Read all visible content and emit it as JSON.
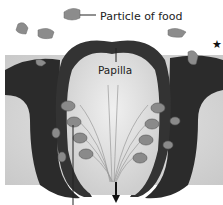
{
  "diagram": {
    "labels": {
      "particle": "Particle of food",
      "papilla": "Papilla"
    },
    "marker": "★",
    "colors": {
      "tissue_dark": "#2a2a2a",
      "tissue_mid": "#4a4a4a",
      "background_tissue": "#d8d8d8",
      "papilla_fill": "#e4e4e4",
      "taste_bud": "#8a8a8a",
      "food_particle": "#8c8c8c",
      "nerve_lines": "#9a9a9a"
    }
  }
}
